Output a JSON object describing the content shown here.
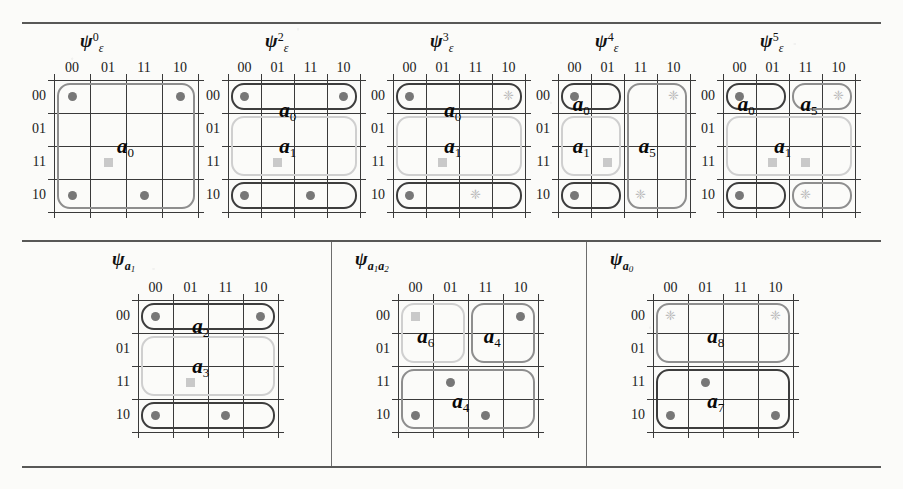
{
  "figure": {
    "rules": [
      "top",
      "middle",
      "bottom"
    ],
    "row1_maps": 5,
    "row2_maps": 3
  },
  "axis": {
    "col_headers": [
      "00",
      "01",
      "11",
      "10"
    ],
    "row_headers": [
      "00",
      "01",
      "11",
      "10"
    ]
  },
  "markers": {
    "dot": "filled-dot",
    "square": "faint-square",
    "star": "faint-star"
  },
  "maps": [
    {
      "id": "psi-eps-0",
      "title": {
        "base": "ψ",
        "sub": "ε",
        "sup": "0"
      },
      "groups": [
        {
          "label": "a",
          "index": "0",
          "style": "med",
          "col": 0,
          "colspan": 4,
          "row": 0,
          "rowspan": 4
        }
      ],
      "labels": [
        {
          "text": "a",
          "sub": "0",
          "col": 1.75,
          "row": 1.45
        }
      ],
      "cells": [
        {
          "type": "dot",
          "col": 0,
          "row": 0
        },
        {
          "type": "dot",
          "col": 3,
          "row": 0
        },
        {
          "type": "square",
          "col": 1,
          "row": 2
        },
        {
          "type": "dot",
          "col": 0,
          "row": 3
        },
        {
          "type": "dot",
          "col": 2,
          "row": 3
        }
      ]
    },
    {
      "id": "psi-eps-2",
      "title": {
        "base": "ψ",
        "sub": "ε",
        "sup": "2"
      },
      "groups": [
        {
          "label": "a",
          "index": "0",
          "style": "dark",
          "col": 0,
          "colspan": 4,
          "row": 0,
          "rowspan": 1
        },
        {
          "label": "a",
          "index": "1",
          "style": "light",
          "col": 0,
          "colspan": 4,
          "row": 1,
          "rowspan": 2
        },
        {
          "label": "",
          "index": "",
          "style": "dark",
          "col": 0,
          "colspan": 4,
          "row": 3,
          "rowspan": 1
        }
      ],
      "labels": [
        {
          "text": "a",
          "sub": "0",
          "col": 1.55,
          "row": 0.35
        },
        {
          "text": "a",
          "sub": "1",
          "col": 1.55,
          "row": 1.45
        }
      ],
      "cells": [
        {
          "type": "dot",
          "col": 0,
          "row": 0
        },
        {
          "type": "dot",
          "col": 3,
          "row": 0
        },
        {
          "type": "square",
          "col": 1,
          "row": 2
        },
        {
          "type": "dot",
          "col": 0,
          "row": 3
        },
        {
          "type": "dot",
          "col": 2,
          "row": 3
        }
      ]
    },
    {
      "id": "psi-eps-3",
      "title": {
        "base": "ψ",
        "sub": "ε",
        "sup": "3"
      },
      "groups": [
        {
          "label": "a",
          "index": "0",
          "style": "dark",
          "col": 0,
          "colspan": 4,
          "row": 0,
          "rowspan": 1
        },
        {
          "label": "a",
          "index": "1",
          "style": "light",
          "col": 0,
          "colspan": 4,
          "row": 1,
          "rowspan": 2
        },
        {
          "label": "",
          "index": "",
          "style": "dark",
          "col": 0,
          "colspan": 4,
          "row": 3,
          "rowspan": 1
        }
      ],
      "labels": [
        {
          "text": "a",
          "sub": "0",
          "col": 1.55,
          "row": 0.35
        },
        {
          "text": "a",
          "sub": "1",
          "col": 1.55,
          "row": 1.45
        }
      ],
      "cells": [
        {
          "type": "dot",
          "col": 0,
          "row": 0
        },
        {
          "type": "star",
          "col": 3,
          "row": 0
        },
        {
          "type": "square",
          "col": 1,
          "row": 2
        },
        {
          "type": "dot",
          "col": 0,
          "row": 3
        },
        {
          "type": "star",
          "col": 2,
          "row": 3
        }
      ]
    },
    {
      "id": "psi-eps-4",
      "title": {
        "base": "ψ",
        "sub": "ε",
        "sup": "4"
      },
      "groups": [
        {
          "label": "a",
          "index": "0",
          "style": "dark",
          "col": 0,
          "colspan": 2,
          "row": 0,
          "rowspan": 1
        },
        {
          "label": "a",
          "index": "1",
          "style": "light",
          "col": 0,
          "colspan": 2,
          "row": 1,
          "rowspan": 2
        },
        {
          "label": "a",
          "index": "5",
          "style": "med",
          "col": 2,
          "colspan": 2,
          "row": 0,
          "rowspan": 4
        },
        {
          "label": "",
          "index": "",
          "style": "dark",
          "col": 0,
          "colspan": 2,
          "row": 3,
          "rowspan": 1
        }
      ],
      "labels": [
        {
          "text": "a",
          "sub": "0",
          "col": 0.45,
          "row": 0.18
        },
        {
          "text": "a",
          "sub": "1",
          "col": 0.45,
          "row": 1.45
        },
        {
          "text": "a",
          "sub": "5",
          "col": 2.45,
          "row": 1.45
        }
      ],
      "cells": [
        {
          "type": "dot",
          "col": 0,
          "row": 0
        },
        {
          "type": "star",
          "col": 3,
          "row": 0
        },
        {
          "type": "square",
          "col": 1,
          "row": 2
        },
        {
          "type": "dot",
          "col": 0,
          "row": 3
        },
        {
          "type": "star",
          "col": 2,
          "row": 3
        }
      ]
    },
    {
      "id": "psi-eps-5",
      "title": {
        "base": "ψ",
        "sub": "ε",
        "sup": "5"
      },
      "groups": [
        {
          "label": "a",
          "index": "0",
          "style": "dark",
          "col": 0,
          "colspan": 2,
          "row": 0,
          "rowspan": 1
        },
        {
          "label": "a",
          "index": "5",
          "style": "med",
          "col": 2,
          "colspan": 2,
          "row": 0,
          "rowspan": 1
        },
        {
          "label": "a",
          "index": "1",
          "style": "light",
          "col": 0,
          "colspan": 4,
          "row": 1,
          "rowspan": 2
        },
        {
          "label": "",
          "index": "",
          "style": "dark",
          "col": 0,
          "colspan": 2,
          "row": 3,
          "rowspan": 1
        },
        {
          "label": "",
          "index": "",
          "style": "med",
          "col": 2,
          "colspan": 2,
          "row": 3,
          "rowspan": 1
        }
      ],
      "labels": [
        {
          "text": "a",
          "sub": "0",
          "col": 0.45,
          "row": 0.18
        },
        {
          "text": "a",
          "sub": "5",
          "col": 2.35,
          "row": 0.18
        },
        {
          "text": "a",
          "sub": "1",
          "col": 1.55,
          "row": 1.45
        }
      ],
      "cells": [
        {
          "type": "dot",
          "col": 0,
          "row": 0
        },
        {
          "type": "star",
          "col": 3,
          "row": 0
        },
        {
          "type": "square",
          "col": 1,
          "row": 2
        },
        {
          "type": "square",
          "col": 2,
          "row": 2
        },
        {
          "type": "dot",
          "col": 0,
          "row": 3
        },
        {
          "type": "star",
          "col": 2,
          "row": 3
        }
      ]
    },
    {
      "id": "psi-a1",
      "title": {
        "base": "ψ",
        "subvar": "a",
        "subvaridx": "1"
      },
      "groups": [
        {
          "label": "a",
          "index": "2",
          "style": "dark",
          "col": 0,
          "colspan": 4,
          "row": 0,
          "rowspan": 1
        },
        {
          "label": "a",
          "index": "3",
          "style": "light",
          "col": 0,
          "colspan": 4,
          "row": 1,
          "rowspan": 2
        },
        {
          "label": "",
          "index": "",
          "style": "dark",
          "col": 0,
          "colspan": 4,
          "row": 3,
          "rowspan": 1
        }
      ],
      "labels": [
        {
          "text": "a",
          "sub": "2",
          "col": 1.55,
          "row": 0.25
        },
        {
          "text": "a",
          "sub": "3",
          "col": 1.55,
          "row": 1.45
        }
      ],
      "cells": [
        {
          "type": "dot",
          "col": 0,
          "row": 0
        },
        {
          "type": "dot",
          "col": 3,
          "row": 0
        },
        {
          "type": "square",
          "col": 1,
          "row": 2
        },
        {
          "type": "dot",
          "col": 0,
          "row": 3
        },
        {
          "type": "dot",
          "col": 2,
          "row": 3
        }
      ]
    },
    {
      "id": "psi-a1a2",
      "title": {
        "base": "ψ",
        "subvar": "a",
        "subvaridx": "1",
        "subvar2": "a",
        "subvaridx2": "2"
      },
      "groups": [
        {
          "label": "a",
          "index": "6",
          "style": "light",
          "col": 0,
          "colspan": 2,
          "row": 0,
          "rowspan": 2
        },
        {
          "label": "a",
          "index": "4",
          "style": "med",
          "col": 2,
          "colspan": 2,
          "row": 0,
          "rowspan": 2
        },
        {
          "label": "a",
          "index": "4",
          "style": "med",
          "col": 0,
          "colspan": 4,
          "row": 2,
          "rowspan": 2
        }
      ],
      "labels": [
        {
          "text": "a",
          "sub": "6",
          "col": 0.55,
          "row": 0.55
        },
        {
          "text": "a",
          "sub": "4",
          "col": 2.45,
          "row": 0.55
        },
        {
          "text": "a",
          "sub": "4",
          "col": 1.55,
          "row": 2.5
        }
      ],
      "cells": [
        {
          "type": "square",
          "col": 0,
          "row": 0
        },
        {
          "type": "dot",
          "col": 3,
          "row": 0
        },
        {
          "type": "dot",
          "col": 1,
          "row": 2
        },
        {
          "type": "dot",
          "col": 0,
          "row": 3
        },
        {
          "type": "dot",
          "col": 2,
          "row": 3
        }
      ]
    },
    {
      "id": "psi-a0",
      "title": {
        "base": "ψ",
        "subvar": "a",
        "subvaridx": "0"
      },
      "groups": [
        {
          "label": "a",
          "index": "8",
          "style": "med",
          "col": 0,
          "colspan": 4,
          "row": 0,
          "rowspan": 2
        },
        {
          "label": "a",
          "index": "7",
          "style": "dark",
          "col": 0,
          "colspan": 4,
          "row": 2,
          "rowspan": 2
        }
      ],
      "labels": [
        {
          "text": "a",
          "sub": "8",
          "col": 1.55,
          "row": 0.55
        },
        {
          "text": "a",
          "sub": "7",
          "col": 1.55,
          "row": 2.5
        }
      ],
      "cells": [
        {
          "type": "star",
          "col": 0,
          "row": 0
        },
        {
          "type": "star",
          "col": 3,
          "row": 0
        },
        {
          "type": "dot",
          "col": 1,
          "row": 2
        },
        {
          "type": "dot",
          "col": 0,
          "row": 3
        },
        {
          "type": "dot",
          "col": 3,
          "row": 3
        }
      ]
    }
  ]
}
